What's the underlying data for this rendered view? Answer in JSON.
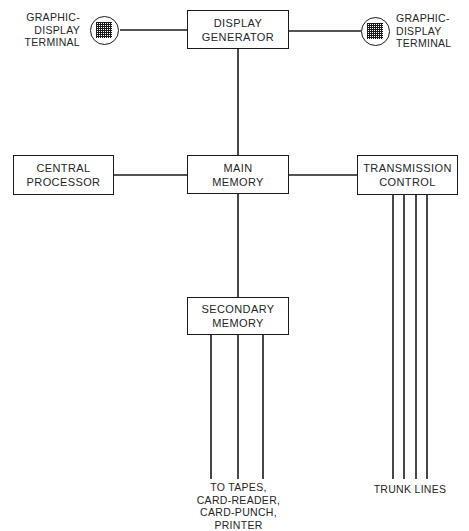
{
  "diagram": {
    "line_color": "#1a1a1a",
    "text_color": "#262626",
    "background": "#ffffff",
    "nodes": [
      {
        "id": "display_generator",
        "label_lines": [
          "DISPLAY",
          "GENERATOR"
        ]
      },
      {
        "id": "central_processor",
        "label_lines": [
          "CENTRAL",
          "PROCESSOR"
        ]
      },
      {
        "id": "main_memory",
        "label_lines": [
          "MAIN",
          "MEMORY"
        ]
      },
      {
        "id": "transmission_control",
        "label_lines": [
          "TRANSMISSION",
          "CONTROL"
        ]
      },
      {
        "id": "secondary_memory",
        "label_lines": [
          "SECONDARY",
          "MEMORY"
        ]
      }
    ],
    "terminals": [
      {
        "id": "graphic_display_terminal_left",
        "icon": "crt-grid-icon",
        "label_lines": [
          "GRAPHIC-",
          "DISPLAY",
          "TERMINAL"
        ]
      },
      {
        "id": "graphic_display_terminal_right",
        "icon": "crt-grid-icon",
        "label_lines": [
          "GRAPHIC-",
          "DISPLAY",
          "TERMINAL"
        ]
      }
    ],
    "captions": [
      {
        "id": "peripherals_caption",
        "lines": [
          "TO TAPES,",
          "CARD-READER,",
          "CARD-PUNCH,",
          "PRINTER"
        ],
        "bus_count": 3
      },
      {
        "id": "trunk_lines_caption",
        "lines": [
          "TRUNK LINES"
        ],
        "bus_count": 4
      }
    ]
  }
}
